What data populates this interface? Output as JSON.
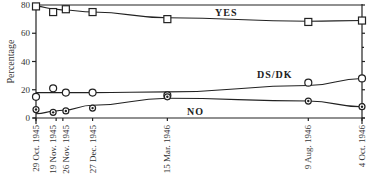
{
  "chart_data": {
    "type": "line",
    "title": "",
    "xlabel": "",
    "ylabel": "Percentage",
    "ylim": [
      0,
      80
    ],
    "yticks": [
      0,
      20,
      40,
      60,
      80
    ],
    "grid": false,
    "x": [
      "29 Oct. 1945",
      "19 Nov. 1945",
      "26 Nov. 1945",
      "27 Dec. 1945",
      "15 Mar. 1946",
      "9 Aug. 1946",
      "4 Oct. 1946"
    ],
    "x_days": [
      0,
      21,
      28,
      59,
      137,
      284,
      340
    ],
    "series": [
      {
        "name": "YES",
        "marker": "square",
        "values": [
          79,
          75,
          77,
          75,
          70,
          68,
          69
        ]
      },
      {
        "name": "DS/DK",
        "marker": "circle",
        "values": [
          15,
          21,
          18,
          18,
          16,
          25,
          28
        ]
      },
      {
        "name": "NO",
        "marker": "circle-dot",
        "values": [
          6,
          4,
          5,
          7,
          15,
          12,
          8
        ]
      }
    ],
    "annotations": [
      "YES",
      "DS/DK",
      "NO"
    ]
  }
}
